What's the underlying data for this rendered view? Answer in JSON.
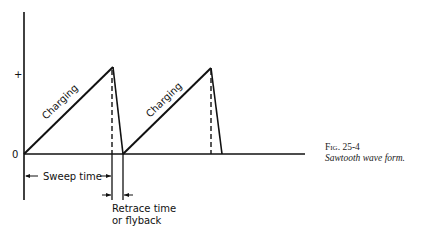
{
  "diagram": {
    "y_axis_labels": {
      "plus": "+",
      "zero": "0"
    },
    "segment_labels": [
      "Charging",
      "Charging"
    ],
    "sweep_label": "Sweep time",
    "retrace_label_lines": [
      "Retrace time",
      "or flyback"
    ]
  },
  "caption": {
    "figure_number": "Fig. 25-4",
    "title": "Sawtooth wave form."
  },
  "colors": {
    "line": "#111111",
    "background": "#ffffff"
  }
}
